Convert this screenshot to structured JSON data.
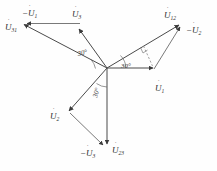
{
  "figure": {
    "type": "phasor-diagram",
    "background_color": "#fefefe",
    "line_color": "#4a4a4a",
    "text_color": "#2e2e2e",
    "origin": {
      "x": 107,
      "y": 68
    }
  },
  "labels": {
    "minus_u1": {
      "text": "U",
      "sub": "1",
      "prefix": "−",
      "dot": "˙",
      "x": 22,
      "y": 16
    },
    "u31": {
      "text": "U",
      "sub": "31",
      "prefix": "",
      "dot": "˙",
      "x": 6,
      "y": 29
    },
    "u3": {
      "text": "U",
      "sub": "3",
      "prefix": "",
      "dot": "˙",
      "x": 73,
      "y": 16
    },
    "u12": {
      "text": "U",
      "sub": "12",
      "prefix": "",
      "dot": "˙",
      "x": 166,
      "y": 17
    },
    "minus_u2": {
      "text": "U",
      "sub": "2",
      "prefix": "−",
      "dot": "˙",
      "x": 190,
      "y": 32
    },
    "u1": {
      "text": "U",
      "sub": "1",
      "prefix": "",
      "dot": "˙",
      "x": 157,
      "y": 90
    },
    "u2": {
      "text": "U",
      "sub": "2",
      "prefix": "",
      "dot": "˙",
      "x": 52,
      "y": 118
    },
    "minus_u3": {
      "text": "U",
      "sub": "3",
      "prefix": "−",
      "dot": "˙",
      "x": 84,
      "y": 155
    },
    "u23": {
      "text": "U",
      "sub": "23",
      "prefix": "",
      "dot": "˙",
      "x": 114,
      "y": 152
    }
  },
  "angles": [
    {
      "name": "angle-upper-left",
      "text": "30°",
      "x": 78,
      "y": 56,
      "rotate": -12
    },
    {
      "name": "angle-right",
      "text": "30°",
      "x": 121,
      "y": 68,
      "rotate": 0
    },
    {
      "name": "angle-lower",
      "text": "30°",
      "x": 97,
      "y": 98,
      "rotate": -74
    }
  ],
  "vectors": [
    {
      "name": "u31-phasor",
      "label": "U31",
      "from": [
        107,
        68
      ],
      "to": [
        22,
        24
      ],
      "arrow": true
    },
    {
      "name": "u3-phasor",
      "label": "U3",
      "from": [
        107,
        68
      ],
      "to": [
        79,
        29
      ],
      "arrow": true
    },
    {
      "name": "minus-u1-segment",
      "label": "-U1",
      "from": [
        79,
        24
      ],
      "to": [
        25,
        24
      ],
      "arrow": true
    },
    {
      "name": "u12-phasor",
      "label": "U12",
      "from": [
        107,
        68
      ],
      "to": [
        180,
        24
      ],
      "arrow": true
    },
    {
      "name": "u1-phasor",
      "label": "U1",
      "from": [
        107,
        68
      ],
      "to": [
        154,
        68
      ],
      "arrow": true
    },
    {
      "name": "minus-u2-segment",
      "label": "-U2",
      "from": [
        155,
        70
      ],
      "to": [
        181,
        26
      ],
      "arrow": true
    },
    {
      "name": "u2-phasor",
      "label": "U2",
      "from": [
        107,
        68
      ],
      "to": [
        68,
        112
      ],
      "arrow": true
    },
    {
      "name": "u23-phasor",
      "label": "U23",
      "from": [
        107,
        68
      ],
      "to": [
        107,
        145
      ],
      "arrow": true
    },
    {
      "name": "minus-u3-segment",
      "label": "-U3",
      "from": [
        70,
        114
      ],
      "to": [
        104,
        146
      ],
      "arrow": true
    }
  ],
  "construction": {
    "dashed_perpendicular": {
      "name": "perpendicular-dashed-line",
      "from": [
        144,
        46
      ],
      "to": [
        153,
        66
      ]
    },
    "right_angle_tick": {
      "name": "right-angle-tick",
      "x": 144,
      "y": 46
    }
  }
}
